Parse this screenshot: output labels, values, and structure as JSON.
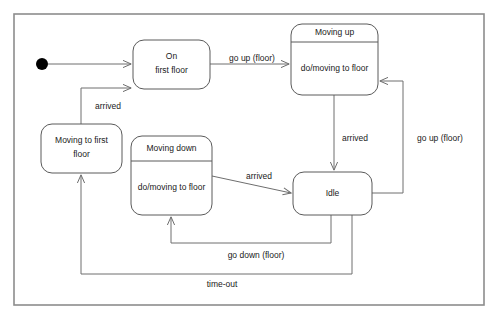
{
  "diagram": {
    "type": "uml-state-diagram",
    "frame": {
      "x": 14,
      "y": 14,
      "width": 470,
      "height": 291
    },
    "colors": {
      "background": "#ffffff",
      "state_border": "#5a5a5a",
      "edge": "#6e6e6e",
      "frame": "#8d8d8d",
      "text": "#1a1a1a",
      "initial_marker": "#000000"
    },
    "initial_state": {
      "name": "initial-pseudostate",
      "cx": 42,
      "cy": 64,
      "r": 6
    },
    "states": [
      {
        "id": "on-first-floor",
        "name": "On first floor",
        "name_lines": [
          "On",
          "first floor"
        ],
        "activity": null,
        "has_compartment": false,
        "x": 133,
        "y": 40,
        "width": 77,
        "height": 49
      },
      {
        "id": "moving-up",
        "name": "Moving up",
        "name_lines": [
          "Moving up"
        ],
        "activity": "do/moving to floor",
        "has_compartment": true,
        "x": 291,
        "y": 24,
        "width": 87,
        "height": 71,
        "divider_y": 42
      },
      {
        "id": "moving-to-first-floor",
        "name": "Moving to first floor",
        "name_lines": [
          "Moving to first",
          "floor"
        ],
        "activity": null,
        "has_compartment": false,
        "x": 41,
        "y": 124,
        "width": 81,
        "height": 49
      },
      {
        "id": "moving-down",
        "name": "Moving down",
        "name_lines": [
          "Moving down"
        ],
        "activity": "do/moving to floor",
        "has_compartment": true,
        "x": 131,
        "y": 136,
        "width": 81,
        "height": 79,
        "divider_y": 161
      },
      {
        "id": "idle",
        "name": "Idle",
        "name_lines": [
          "Idle"
        ],
        "activity": null,
        "has_compartment": false,
        "x": 293,
        "y": 172,
        "width": 79,
        "height": 43
      }
    ],
    "transitions": [
      {
        "id": "start-to-on-first-floor",
        "from": "initial-pseudostate",
        "to": "on-first-floor",
        "label": null
      },
      {
        "id": "on-first-floor-to-moving-up",
        "from": "on-first-floor",
        "to": "moving-up",
        "label": "go up (floor)",
        "label_x": 252,
        "label_y": 59
      },
      {
        "id": "moving-up-to-idle",
        "from": "moving-up",
        "to": "idle",
        "label": "arrived",
        "label_x": 355,
        "label_y": 139
      },
      {
        "id": "idle-to-moving-up",
        "from": "idle",
        "to": "moving-up",
        "label": "go up (floor)",
        "label_x": 440,
        "label_y": 139
      },
      {
        "id": "idle-to-moving-down",
        "from": "idle",
        "to": "moving-down",
        "label": "go down (floor)",
        "label_x": 256,
        "label_y": 256
      },
      {
        "id": "moving-down-to-idle",
        "from": "moving-down",
        "to": "idle",
        "label": "arrived",
        "label_x": 259,
        "label_y": 177
      },
      {
        "id": "idle-to-moving-to-first-floor",
        "from": "idle",
        "to": "moving-to-first-floor",
        "label": "time-out",
        "label_x": 222,
        "label_y": 285
      },
      {
        "id": "moving-to-first-floor-to-on-first-floor",
        "from": "moving-to-first-floor",
        "to": "on-first-floor",
        "label": "arrived",
        "label_x": 108,
        "label_y": 107
      }
    ]
  }
}
